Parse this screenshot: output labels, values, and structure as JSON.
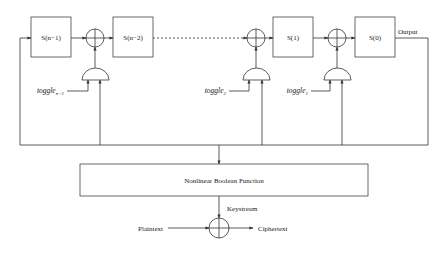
{
  "diagram": {
    "title": "",
    "registers": [
      {
        "id": "s_n_1",
        "label": "S(n−1)",
        "x": 31
      },
      {
        "id": "s_n_2",
        "label": "S(n−2)",
        "x": 113
      },
      {
        "id": "s_1",
        "label": "S(1)",
        "x": 273
      },
      {
        "id": "s_0",
        "label": "S(0)",
        "x": 355
      }
    ],
    "toggles": [
      {
        "id": "toggle_n_1",
        "base": "toggle",
        "subscript": "n−1"
      },
      {
        "id": "toggle_2",
        "base": "toggle",
        "subscript": "2"
      },
      {
        "id": "toggle_1",
        "base": "toggle",
        "subscript": "1"
      }
    ],
    "output_label": "Output",
    "nonlinear_function_label": "Nonlinear Boolean Function",
    "keystream_label": "Keystream",
    "plaintext_label": "Plaintext",
    "ciphertext_label": "Ciphertext",
    "colors": {
      "line": "#333333",
      "background": "#ffffff"
    }
  }
}
